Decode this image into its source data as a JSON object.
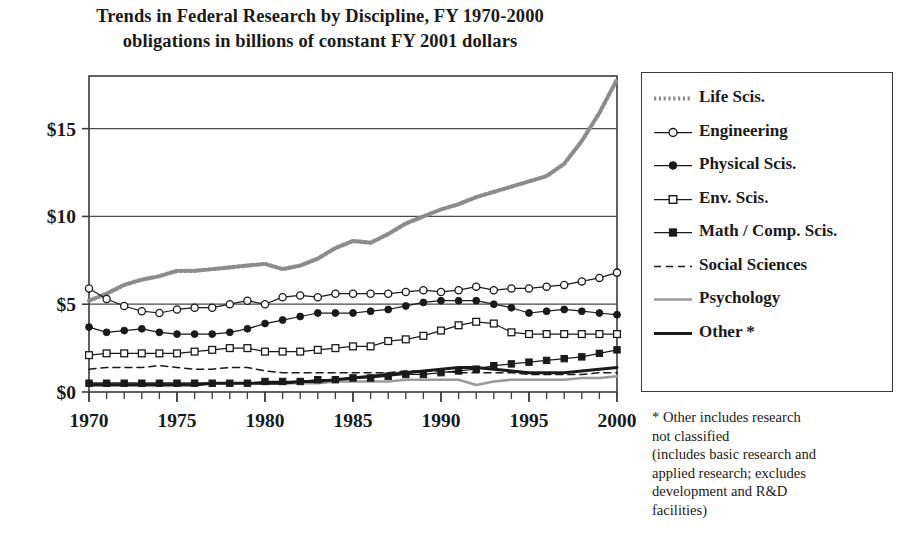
{
  "title": {
    "line1": "Trends in Federal Research by Discipline, FY 1970-2000",
    "line2": "obligations in billions of constant FY 2001 dollars"
  },
  "footnote": {
    "line1": "* Other includes research",
    "line2": "not classified",
    "line3": "(includes basic research and",
    "line4": "applied research; excludes",
    "line5": "development and R&D",
    "line6": "facilities)"
  },
  "colors": {
    "axis": "#3a3a3a",
    "grid": "#4a4a4a",
    "ink": "#1a1a1a",
    "life": "#8c8c8c",
    "psychology": "#9a9a9a",
    "background": "#ffffff"
  },
  "legend": {
    "items": [
      {
        "label": "Life Scis.",
        "style": "dotted-thick",
        "marker": "none"
      },
      {
        "label": "Engineering",
        "style": "solid-thin",
        "marker": "open-circle"
      },
      {
        "label": "Physical Scis.",
        "style": "solid-thin",
        "marker": "filled-circle"
      },
      {
        "label": "Env. Scis.",
        "style": "solid-thin",
        "marker": "open-square"
      },
      {
        "label": "Math / Comp. Scis.",
        "style": "solid-thin",
        "marker": "filled-square"
      },
      {
        "label": "Social Sciences",
        "style": "dashed",
        "marker": "none"
      },
      {
        "label": "Psychology",
        "style": "solid-gray",
        "marker": "none"
      },
      {
        "label": "Other *",
        "style": "solid-thick",
        "marker": "none"
      }
    ]
  },
  "chart_data": {
    "type": "line",
    "title": "Trends in Federal Research by Discipline, FY 1970-2000",
    "subtitle": "obligations in billions of constant FY 2001 dollars",
    "xlabel": "",
    "ylabel": "",
    "xlim": [
      1970,
      2000
    ],
    "ylim": [
      0,
      18
    ],
    "ytick_values": [
      0,
      5,
      10,
      15
    ],
    "ytick_labels": [
      "$0",
      "$5",
      "$10",
      "$15"
    ],
    "xtick_values": [
      1970,
      1975,
      1980,
      1985,
      1990,
      1995,
      2000
    ],
    "xtick_labels": [
      "1970",
      "1975",
      "1980",
      "1985",
      "1990",
      "1995",
      "2000"
    ],
    "minor_xticks": true,
    "grid": "horizontal",
    "legend_position": "right-outside",
    "x": [
      1970,
      1971,
      1972,
      1973,
      1974,
      1975,
      1976,
      1977,
      1978,
      1979,
      1980,
      1981,
      1982,
      1983,
      1984,
      1985,
      1986,
      1987,
      1988,
      1989,
      1990,
      1991,
      1992,
      1993,
      1994,
      1995,
      1996,
      1997,
      1998,
      1999,
      2000
    ],
    "series": [
      {
        "name": "Life Scis.",
        "values": [
          5.2,
          5.6,
          6.1,
          6.4,
          6.6,
          6.9,
          6.9,
          7.0,
          7.1,
          7.2,
          7.3,
          7.0,
          7.2,
          7.6,
          8.2,
          8.6,
          8.5,
          9.0,
          9.6,
          10.0,
          10.4,
          10.7,
          11.1,
          11.4,
          11.7,
          12.0,
          12.3,
          13.0,
          14.3,
          15.9,
          17.8
        ]
      },
      {
        "name": "Engineering",
        "values": [
          5.9,
          5.3,
          4.9,
          4.6,
          4.5,
          4.7,
          4.8,
          4.8,
          5.0,
          5.2,
          5.0,
          5.4,
          5.5,
          5.4,
          5.6,
          5.6,
          5.6,
          5.6,
          5.7,
          5.8,
          5.7,
          5.8,
          6.0,
          5.8,
          5.9,
          5.9,
          6.0,
          6.1,
          6.3,
          6.5,
          6.8
        ]
      },
      {
        "name": "Physical Scis.",
        "values": [
          3.7,
          3.4,
          3.5,
          3.6,
          3.4,
          3.3,
          3.3,
          3.3,
          3.4,
          3.6,
          3.9,
          4.1,
          4.3,
          4.5,
          4.5,
          4.5,
          4.6,
          4.7,
          4.9,
          5.1,
          5.2,
          5.2,
          5.2,
          5.0,
          4.8,
          4.5,
          4.6,
          4.7,
          4.6,
          4.5,
          4.4
        ]
      },
      {
        "name": "Env. Scis.",
        "values": [
          2.1,
          2.2,
          2.2,
          2.2,
          2.2,
          2.2,
          2.3,
          2.4,
          2.5,
          2.5,
          2.3,
          2.3,
          2.3,
          2.4,
          2.5,
          2.6,
          2.6,
          2.9,
          3.0,
          3.2,
          3.5,
          3.8,
          4.0,
          3.9,
          3.4,
          3.3,
          3.3,
          3.3,
          3.3,
          3.3,
          3.3
        ]
      },
      {
        "name": "Math / Comp. Scis.",
        "values": [
          0.5,
          0.5,
          0.5,
          0.5,
          0.5,
          0.5,
          0.5,
          0.5,
          0.5,
          0.5,
          0.6,
          0.6,
          0.6,
          0.7,
          0.7,
          0.8,
          0.8,
          0.9,
          1.0,
          1.0,
          1.1,
          1.2,
          1.3,
          1.5,
          1.6,
          1.7,
          1.8,
          1.9,
          2.0,
          2.2,
          2.4
        ]
      },
      {
        "name": "Social Sciences",
        "values": [
          1.3,
          1.4,
          1.4,
          1.4,
          1.5,
          1.4,
          1.3,
          1.3,
          1.4,
          1.4,
          1.2,
          1.1,
          1.1,
          1.1,
          1.1,
          1.1,
          1.1,
          1.1,
          1.2,
          1.2,
          1.2,
          1.1,
          1.1,
          1.1,
          1.1,
          1.0,
          1.0,
          1.0,
          1.0,
          1.1,
          1.1
        ]
      },
      {
        "name": "Psychology",
        "values": [
          0.5,
          0.5,
          0.5,
          0.5,
          0.5,
          0.5,
          0.5,
          0.5,
          0.5,
          0.5,
          0.5,
          0.5,
          0.5,
          0.5,
          0.6,
          0.6,
          0.6,
          0.6,
          0.7,
          0.7,
          0.7,
          0.7,
          0.4,
          0.6,
          0.7,
          0.7,
          0.7,
          0.7,
          0.8,
          0.8,
          0.9
        ]
      },
      {
        "name": "Other *",
        "values": [
          0.4,
          0.4,
          0.4,
          0.4,
          0.4,
          0.4,
          0.4,
          0.5,
          0.5,
          0.5,
          0.5,
          0.5,
          0.6,
          0.6,
          0.7,
          0.8,
          0.9,
          1.0,
          1.1,
          1.2,
          1.3,
          1.4,
          1.4,
          1.3,
          1.2,
          1.1,
          1.1,
          1.1,
          1.2,
          1.3,
          1.4
        ]
      }
    ]
  }
}
